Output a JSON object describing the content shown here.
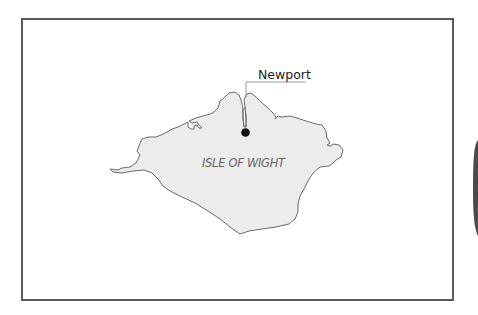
{
  "map": {
    "region_label": "ISLE OF WIGHT",
    "places": [
      {
        "name": "Newport",
        "marker": "filled-circle"
      }
    ],
    "colors": {
      "frame": "#5a5a5a",
      "land_fill": "#ececec",
      "coastline": "#6a6a6a",
      "marker": "#111111",
      "leader_line": "#999999",
      "background": "#ffffff"
    }
  }
}
